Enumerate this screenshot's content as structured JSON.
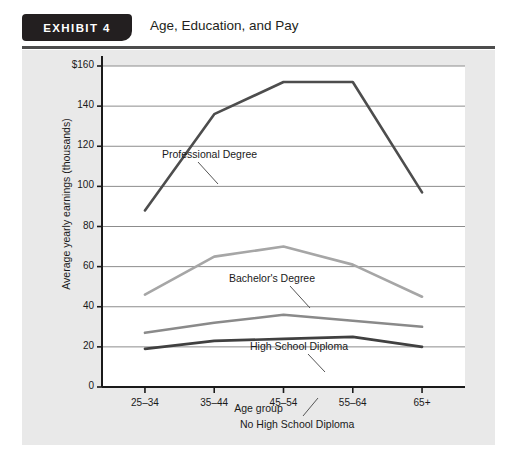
{
  "exhibit": {
    "tab_label": "EXHIBIT 4",
    "title": "Age, Education, and Pay"
  },
  "colors": {
    "panel_background": "#e9e9e9",
    "plot_background": "#ffffff",
    "axis": "#1a1a1a",
    "gridline": "#8c8c8c",
    "tab_background": "#231f20",
    "series_professional": "#4d4d4d",
    "series_bachelors": "#a6a6a6",
    "series_high_school": "#8a8a8a",
    "series_no_high_school": "#404040"
  },
  "chart_data": {
    "type": "line",
    "title": "Age, Education, and Pay",
    "xlabel": "Age group",
    "ylabel": "Average yearly earnings (thousands)",
    "categories": [
      "25–34",
      "35–44",
      "45–54",
      "55–64",
      "65+"
    ],
    "ylim": [
      0,
      160
    ],
    "yticks": [
      0,
      20,
      40,
      60,
      80,
      100,
      120,
      140,
      160
    ],
    "ytick_labels": [
      "0",
      "20",
      "40",
      "60",
      "80",
      "100",
      "120",
      "140",
      "$160"
    ],
    "grid": true,
    "legend": "annotations",
    "series": [
      {
        "name": "Professional Degree",
        "color": "#4d4d4d",
        "values": [
          88,
          136,
          152,
          152,
          97
        ],
        "annotation": {
          "label": "Professional Degree",
          "x": 140,
          "y": 98
        }
      },
      {
        "name": "Bachelor's Degree",
        "color": "#a6a6a6",
        "values": [
          46,
          65,
          70,
          61,
          45
        ],
        "annotation": {
          "label": "Bachelor's Degree",
          "x": 207,
          "y": 222
        }
      },
      {
        "name": "High School Diploma",
        "color": "#8a8a8a",
        "values": [
          27,
          32,
          36,
          33,
          30
        ],
        "annotation": {
          "label": "High School Diploma",
          "x": 228,
          "y": 290
        }
      },
      {
        "name": "No High School Diploma",
        "color": "#404040",
        "values": [
          19,
          23,
          24,
          25,
          20
        ],
        "annotation": {
          "label": "No High School Diploma",
          "x": 218,
          "y": 368
        }
      }
    ]
  }
}
